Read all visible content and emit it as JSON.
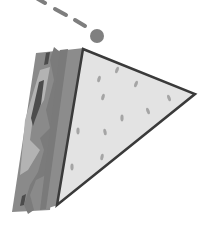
{
  "illustration": {
    "subject": "sandwich-triangle-icon",
    "colors": {
      "background": "#ffffff",
      "face": "#e3e3e3",
      "outline": "#3a3a3a",
      "crust": "#8c8c8c",
      "crust_dark": "#7b7b7b",
      "filling_light": "#b3b3b3",
      "filling_dark": "#4c4c4c",
      "spot": "#a5a5a5",
      "dashed_line": "#7e7e7e",
      "ball": "#808080"
    },
    "spots": [
      {
        "x": 117,
        "y": 70,
        "rot": 20
      },
      {
        "x": 99,
        "y": 79,
        "rot": 15
      },
      {
        "x": 136,
        "y": 84,
        "rot": 20
      },
      {
        "x": 103,
        "y": 97,
        "rot": 15
      },
      {
        "x": 169,
        "y": 98,
        "rot": -20
      },
      {
        "x": 148,
        "y": 111,
        "rot": -20
      },
      {
        "x": 122,
        "y": 118,
        "rot": 0
      },
      {
        "x": 78,
        "y": 131,
        "rot": 0
      },
      {
        "x": 105,
        "y": 132,
        "rot": -10
      },
      {
        "x": 102,
        "y": 157,
        "rot": 10
      },
      {
        "x": 72,
        "y": 167,
        "rot": 0
      }
    ]
  }
}
